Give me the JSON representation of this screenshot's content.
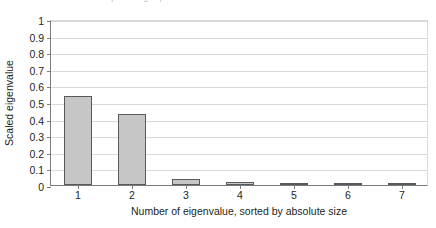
{
  "caption_fragment": "cut-off descenders of preceding caption line",
  "chart_data": {
    "type": "bar",
    "title": "",
    "xlabel": "Number of eigenvalue, sorted by absolute size",
    "ylabel": "Scaled eigenvalue",
    "categories": [
      "1",
      "2",
      "3",
      "4",
      "5",
      "6",
      "7"
    ],
    "values": [
      0.535,
      0.425,
      0.035,
      0.018,
      0.008,
      0.003,
      0.002
    ],
    "ylim": [
      0,
      1
    ],
    "yticks": [
      "0",
      "0.1",
      "0.2",
      "0.3",
      "0.4",
      "0.5",
      "0.6",
      "0.7",
      "0.8",
      "0.9",
      "1"
    ],
    "ytick_values": [
      0,
      0.1,
      0.2,
      0.3,
      0.4,
      0.5,
      0.6,
      0.7,
      0.8,
      0.9,
      1
    ],
    "xticks": [
      "1",
      "2",
      "3",
      "4",
      "5",
      "6",
      "7"
    ],
    "grid": "horizontal",
    "legend": "none",
    "colors": {
      "bar_fill": "#c6c6c6",
      "bar_edge": "#58595b",
      "gridline": "#d9d9d9",
      "axis": "#7a7a7a",
      "text": "#231f20",
      "background": "#ffffff"
    }
  }
}
